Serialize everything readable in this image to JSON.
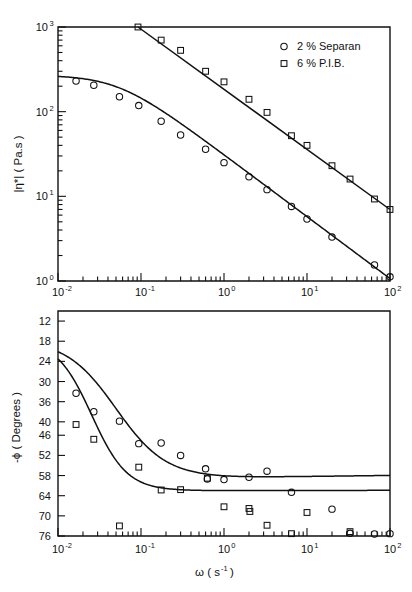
{
  "figure": {
    "background_color": "#ffffff",
    "ink_color": "#111111"
  },
  "legend": {
    "position": "top-right-of-upper-panel",
    "entries": [
      {
        "marker": "circle",
        "label": "2 %  Separan"
      },
      {
        "marker": "square",
        "label": "6 %  P.I.B."
      }
    ]
  },
  "chart_data": [
    {
      "id": "upper-panel",
      "type": "line",
      "title": "",
      "xlabel": "",
      "ylabel": "|η*| ( Pa.s )",
      "xscale": "log",
      "yscale": "log",
      "xlim": [
        0.01,
        100
      ],
      "ylim": [
        1,
        1000
      ],
      "grid": false,
      "xtick_labels": [
        "10-2",
        "10-1",
        "100",
        "101",
        "102"
      ],
      "xtick_mantissa": [
        "10",
        "10",
        "10",
        "10",
        "10"
      ],
      "xtick_exponent": [
        "-2",
        "-1",
        "0",
        "1",
        "2"
      ],
      "ytick_mantissa": [
        "10",
        "10",
        "10",
        "10"
      ],
      "ytick_exponent": [
        "3",
        "2",
        "1",
        "0"
      ],
      "series": [
        {
          "name": "2 %  Separan",
          "marker": "circle",
          "points": [
            [
              0.0165,
              230
            ],
            [
              0.027,
              205
            ],
            [
              0.055,
              150
            ],
            [
              0.094,
              118
            ],
            [
              0.175,
              77
            ],
            [
              0.3,
              53
            ],
            [
              0.6,
              36
            ],
            [
              1.0,
              25
            ],
            [
              2.0,
              17
            ],
            [
              3.3,
              12
            ],
            [
              6.5,
              7.6
            ],
            [
              10.0,
              5.4
            ],
            [
              20.0,
              3.3
            ],
            [
              65.0,
              1.55
            ],
            [
              100.0,
              1.12
            ]
          ],
          "fit_curve": "plateau_then_power_law",
          "fit_plateau_value": 270,
          "fit_slope": -0.73
        },
        {
          "name": "6 %  P.I.B.",
          "marker": "square",
          "points": [
            [
              0.092,
              1000
            ],
            [
              0.175,
              700
            ],
            [
              0.3,
              530
            ],
            [
              0.6,
              300
            ],
            [
              1.0,
              225
            ],
            [
              2.0,
              140
            ],
            [
              3.3,
              98
            ],
            [
              6.5,
              52
            ],
            [
              10.0,
              40
            ],
            [
              20.0,
              23
            ],
            [
              33.0,
              16
            ],
            [
              65.0,
              9.3
            ],
            [
              100.0,
              7.0
            ]
          ],
          "fit_curve": "power_law",
          "fit_slope": -0.71
        }
      ]
    },
    {
      "id": "lower-panel",
      "type": "line",
      "title": "",
      "xlabel": "ω ( s-1 )",
      "xlabel_base": "ω ( s",
      "xlabel_exponent": "-1",
      "xlabel_tail": " )",
      "ylabel": "-ϕ ( Degrees )",
      "xscale": "log",
      "yscale": "linear-inverted",
      "xlim": [
        0.01,
        100
      ],
      "ylim": [
        76,
        9
      ],
      "grid": false,
      "ytick_labels": [
        "12",
        "18",
        "24",
        "30",
        "36",
        "40",
        "46",
        "52",
        "58",
        "64",
        "70",
        "76"
      ],
      "ytick_values": [
        12,
        18,
        24,
        30,
        36,
        42,
        46,
        52,
        58,
        64,
        70,
        76
      ],
      "xtick_mantissa": [
        "10",
        "10",
        "10",
        "10",
        "10"
      ],
      "xtick_exponent": [
        "-2",
        "-1",
        "0",
        "1",
        "2"
      ],
      "series": [
        {
          "name": "2 %  Separan",
          "marker": "circle",
          "points": [
            [
              0.0165,
              33.5
            ],
            [
              0.027,
              39.0
            ],
            [
              0.055,
              41.8
            ],
            [
              0.094,
              48.5
            ],
            [
              0.175,
              48.3
            ],
            [
              0.3,
              52.0
            ],
            [
              0.6,
              56.0
            ],
            [
              0.63,
              59.0
            ],
            [
              1.0,
              59.2
            ],
            [
              2.0,
              58.5
            ],
            [
              3.3,
              56.7
            ],
            [
              6.5,
              63.0
            ],
            [
              20.0,
              68.0
            ],
            [
              33.0,
              75.2
            ],
            [
              65.0,
              75.4
            ],
            [
              100.0,
              75.3
            ]
          ],
          "fit_curve": "decay_to_plateau",
          "fit_start_value": 17.5,
          "fit_plateau_value": 58.6
        },
        {
          "name": "6 %  P.I.B.",
          "marker": "square",
          "points": [
            [
              0.0165,
              42.8
            ],
            [
              0.027,
              47.2
            ],
            [
              0.055,
              73.0
            ],
            [
              0.094,
              55.5
            ],
            [
              0.175,
              62.3
            ],
            [
              0.3,
              62.2
            ],
            [
              0.63,
              58.8
            ],
            [
              1.0,
              67.3
            ],
            [
              2.0,
              67.8
            ],
            [
              2.05,
              68.7
            ],
            [
              3.3,
              72.8
            ],
            [
              6.5,
              75.3
            ],
            [
              10.0,
              69.0
            ],
            [
              33.0,
              74.7
            ]
          ],
          "fit_curve": "decay_to_plateau",
          "fit_start_value": 17.5,
          "fit_plateau_value": 62.5
        }
      ]
    }
  ]
}
